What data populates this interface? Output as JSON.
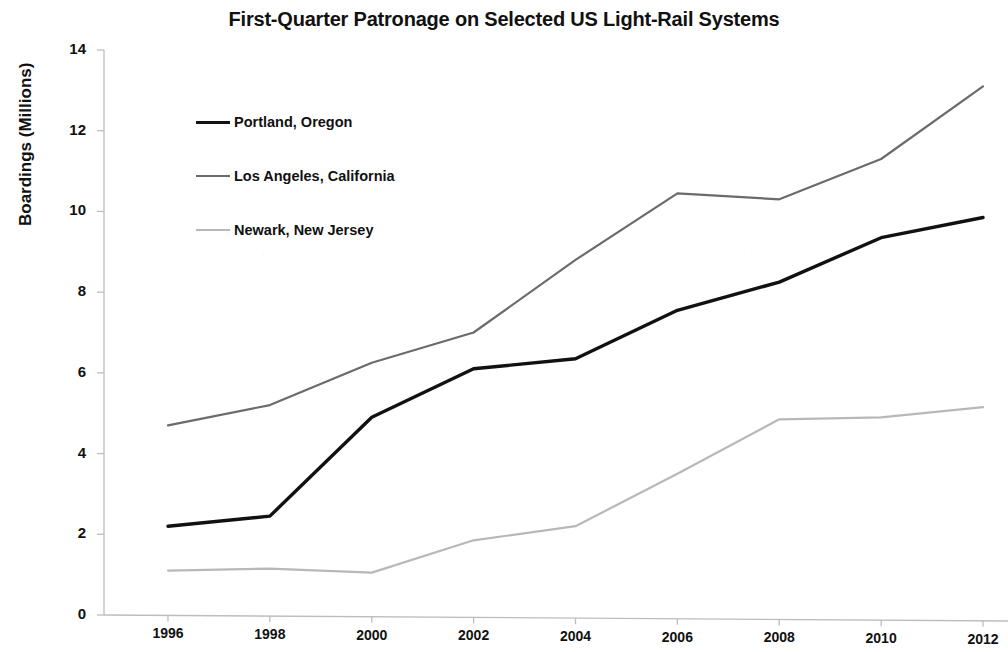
{
  "chart_data": {
    "type": "line",
    "title": "First-Quarter Patronage on Selected US Light-Rail Systems",
    "xlabel": "",
    "ylabel": "Boardings (Millions)",
    "x": [
      1996,
      1998,
      2000,
      2002,
      2004,
      2006,
      2008,
      2010,
      2012
    ],
    "xtick_labels": [
      "1996",
      "1998",
      "2000",
      "2002",
      "2004",
      "2006",
      "2008",
      "2010",
      "2012"
    ],
    "ytick_labels": [
      "0",
      "2",
      "4",
      "6",
      "8",
      "10",
      "12",
      "14"
    ],
    "yticks": [
      0,
      2,
      4,
      6,
      8,
      10,
      12,
      14
    ],
    "xlim": [
      1996,
      2012
    ],
    "ylim": [
      0,
      14
    ],
    "grid": false,
    "legend_position": "upper-left-inside",
    "series": [
      {
        "name": "Portland, Oregon",
        "color": "#111111",
        "line_width": 3.4,
        "values": [
          2.2,
          2.45,
          4.9,
          6.1,
          6.35,
          7.55,
          8.25,
          9.35,
          9.85
        ]
      },
      {
        "name": "Los Angeles, California",
        "color": "#6b6b6b",
        "line_width": 2.2,
        "values": [
          4.7,
          5.2,
          6.25,
          7.0,
          8.8,
          10.45,
          10.3,
          11.3,
          13.1
        ]
      },
      {
        "name": "Newark, New Jersey",
        "color": "#b8b8b8",
        "line_width": 2.2,
        "values": [
          1.1,
          1.15,
          1.05,
          1.85,
          2.2,
          3.5,
          4.85,
          4.9,
          5.15
        ]
      }
    ]
  },
  "axis": {
    "line_color": "#bdbdbd"
  }
}
